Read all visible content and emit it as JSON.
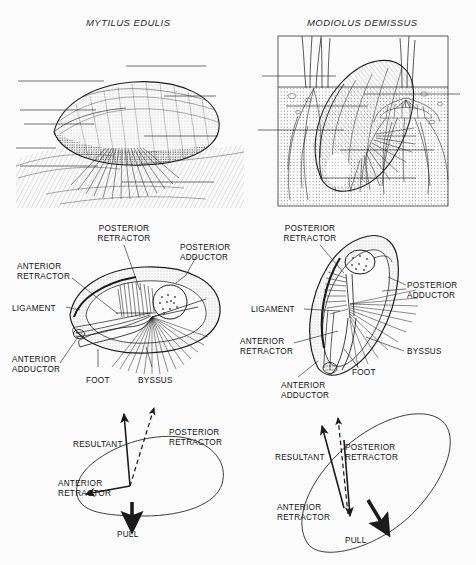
{
  "figure": {
    "background_color": "#fbfbfb",
    "ink_color": "#1b1b1b",
    "columns": [
      {
        "title": "MYTILUS EDULIS"
      },
      {
        "title": "MODIOLUS DEMISSUS"
      }
    ]
  },
  "row_habitat": {
    "left": {
      "caption": "MYTILUS EDULIS",
      "scene": "mussel attached by byssal threads to rock surface, epibenthic"
    },
    "right": {
      "caption": "MODIOLUS DEMISSUS",
      "scene": "ribbed mussel burrowed in sediment among marsh grass roots"
    }
  },
  "row_anatomy": {
    "left": {
      "labels": {
        "posterior_retractor": "POSTERIOR\nRETRACTOR",
        "posterior_retractor_l1": "POSTERIOR",
        "posterior_retractor_l2": "RETRACTOR",
        "posterior_adductor_l1": "POSTERIOR",
        "posterior_adductor_l2": "ADDUCTOR",
        "anterior_retractor_l1": "ANTERIOR",
        "anterior_retractor_l2": "RETRACTOR",
        "ligament": "LIGAMENT",
        "anterior_adductor_l1": "ANTERIOR",
        "anterior_adductor_l2": "ADDUCTOR",
        "foot": "FOOT",
        "byssus": "BYSSUS"
      }
    },
    "right": {
      "labels": {
        "posterior_retractor_l1": "POSTERIOR",
        "posterior_retractor_l2": "RETRACTOR",
        "posterior_adductor_l1": "POSTERIOR",
        "posterior_adductor_l2": "ADDUCTOR",
        "anterior_retractor_l1": "ANTERIOR",
        "anterior_retractor_l2": "RETRACTOR",
        "ligament": "LIGAMENT",
        "anterior_adductor_l1": "ANTERIOR",
        "anterior_adductor_l2": "ADDUCTOR",
        "foot": "FOOT",
        "byssus": "BYSSUS"
      }
    }
  },
  "row_forces": {
    "left": {
      "labels": {
        "resultant": "RESULTANT",
        "posterior_retractor_l1": "POSTERIOR",
        "posterior_retractor_l2": "RETRACTOR",
        "anterior_retractor_l1": "ANTERIOR",
        "anterior_retractor_l2": "RETRACTOR",
        "pull": "PULL"
      },
      "vectors": [
        {
          "name": "posterior-retractor",
          "style": "solid",
          "direction": "up"
        },
        {
          "name": "resultant",
          "style": "dashed",
          "direction": "up-right"
        },
        {
          "name": "anterior-retractor",
          "style": "solid",
          "direction": "down-left"
        },
        {
          "name": "pull",
          "style": "thick",
          "direction": "down"
        }
      ]
    },
    "right": {
      "labels": {
        "resultant": "RESULTANT",
        "posterior_retractor_l1": "POSTERIOR",
        "posterior_retractor_l2": "RETRACTOR",
        "anterior_retractor_l1": "ANTERIOR",
        "anterior_retractor_l2": "RETRACTOR",
        "pull": "PULL"
      },
      "vectors": [
        {
          "name": "posterior-retractor",
          "style": "solid",
          "direction": "up"
        },
        {
          "name": "resultant",
          "style": "dashed",
          "direction": "up"
        },
        {
          "name": "anterior-retractor",
          "style": "solid",
          "direction": "up-left"
        },
        {
          "name": "pull",
          "style": "thick",
          "direction": "down-right"
        }
      ]
    }
  }
}
